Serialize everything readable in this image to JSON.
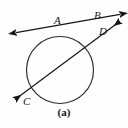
{
  "figure": {
    "caption": "(a)",
    "stroke_color": "#1a1a1a",
    "fill_color": "none",
    "background_color": "#fefefe",
    "labels": {
      "A": "A",
      "B": "B",
      "C": "C",
      "D": "D"
    },
    "circle": {
      "center_x": 60,
      "center_y": 70,
      "radius": 34
    },
    "lines": [
      {
        "name": "secant-through-A-and-B",
        "x1": 14,
        "y1": 33,
        "x2": 122,
        "y2": 14,
        "arrow_start": true,
        "arrow_end": true
      },
      {
        "name": "secant-through-D-and-C",
        "x1": 122,
        "y1": 22,
        "x2": 13,
        "y2": 101,
        "arrow_start": true,
        "arrow_end": true
      }
    ],
    "intersection_point": {
      "x": 89,
      "y": 29
    }
  }
}
